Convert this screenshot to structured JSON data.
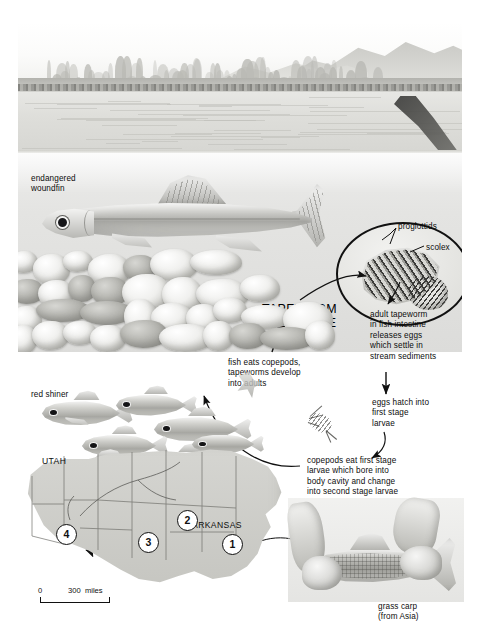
{
  "figure": {
    "title": "TAPEWORM\nLIFE CYCLE"
  },
  "labels": {
    "endangered_woundfin": "endangered\nwoundfin",
    "proglottids": "proglottids",
    "scolex": "scolex",
    "red_shiner": "red shiner",
    "grass_carp": "grass carp\n(from Asia)"
  },
  "cycle_steps": [
    {
      "id": "step-adult-tapeworm",
      "text": "adult tapeworm\nin fish intestine\nreleases eggs\nwhich settle in\nstream sediments"
    },
    {
      "id": "step-eggs-hatch",
      "text": "eggs hatch into\nfirst stage\nlarvae"
    },
    {
      "id": "step-copepods-eat",
      "text": "copepods eat first stage\nlarvae which bore into\nbody cavity and change\ninto second stage larvae"
    },
    {
      "id": "step-fish-eats-copepods",
      "text": "fish eats copepods,\ntapeworms develop\ninto adults"
    }
  ],
  "map": {
    "state_labels": [
      {
        "name": "UTAH",
        "text": "UTAH"
      },
      {
        "name": "ARKANSAS",
        "text": "ARKANSAS"
      }
    ],
    "markers": [
      {
        "id": 1,
        "label": "1"
      },
      {
        "id": 2,
        "label": "2"
      },
      {
        "id": 3,
        "label": "3"
      },
      {
        "id": 4,
        "label": "4"
      }
    ],
    "scale": {
      "zero": "0",
      "distance": "300  miles"
    }
  },
  "colors": {
    "ink": "#101010",
    "paper": "#ffffff",
    "land": "#d0d0cc",
    "water": "#dedeDA"
  }
}
